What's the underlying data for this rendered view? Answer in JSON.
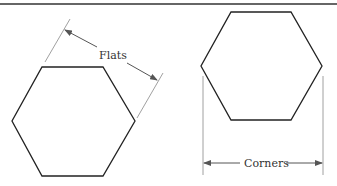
{
  "diagram": {
    "labels": {
      "flats": "Flats",
      "corners": "Corners"
    },
    "colors": {
      "shape_stroke": "#222222",
      "dimension_stroke": "#777777",
      "arrow": "#555555",
      "rule": "#333333",
      "background": "#ffffff"
    },
    "shapes": [
      {
        "name": "hexagon-flats",
        "measurement": "Flats"
      },
      {
        "name": "hexagon-corners",
        "measurement": "Corners"
      }
    ]
  }
}
